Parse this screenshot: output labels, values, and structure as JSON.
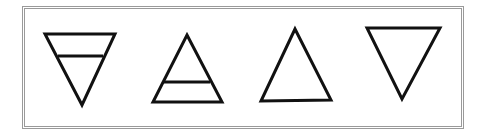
{
  "figure": {
    "stroke_color": "#111111",
    "border_color": "#9a9a9a",
    "symbols": [
      {
        "name": "earth",
        "shape": "triangle-down-with-bar"
      },
      {
        "name": "air",
        "shape": "triangle-up-with-bar"
      },
      {
        "name": "fire",
        "shape": "triangle-up"
      },
      {
        "name": "water",
        "shape": "triangle-down"
      }
    ]
  }
}
